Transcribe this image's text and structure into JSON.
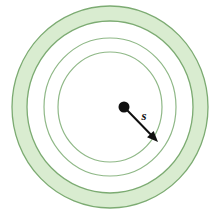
{
  "figure": {
    "background_color": "#ffffff",
    "canvas": {
      "width": 219,
      "height": 219
    },
    "center": {
      "x": 110,
      "y": 107
    },
    "colors": {
      "ring_fill": "#d9ecd0",
      "ring_stroke": "#7cab72",
      "inner_stroke": "#8fb887",
      "marker": "#111111",
      "arrow": "#111111",
      "label_text": "#111111"
    },
    "center_dot": {
      "label": "center-point",
      "radius": 5.5,
      "color": "#111111"
    },
    "rings": [
      {
        "name": "outer-band-outer-edge",
        "rx": 98,
        "ry": 101,
        "filled": true,
        "fill": "#d9ecd0",
        "stroke": "#7cab72",
        "stroke_width": 1.3
      },
      {
        "name": "outer-band-inner-edge",
        "rx": 83,
        "ry": 86,
        "filled": false,
        "fill": "#ffffff",
        "stroke": "#7cab72",
        "stroke_width": 1.3
      },
      {
        "name": "middle-circle",
        "rx": 66,
        "ry": 69,
        "filled": false,
        "fill": "none",
        "stroke": "#8fb887",
        "stroke_width": 1.2
      },
      {
        "name": "inner-circle",
        "rx": 52,
        "ry": 55,
        "filled": false,
        "fill": "none",
        "stroke": "#8fb887",
        "stroke_width": 1.2
      }
    ],
    "radius_arrow": {
      "name": "radius-arrow",
      "from": {
        "x": 125,
        "y": 108
      },
      "to": {
        "x": 158,
        "y": 142
      },
      "stroke": "#111111",
      "stroke_width": 2,
      "arrowhead": "filled-triangle"
    },
    "radius_label": {
      "text": "s",
      "x": 144,
      "y": 120,
      "style": "bold-italic"
    }
  }
}
